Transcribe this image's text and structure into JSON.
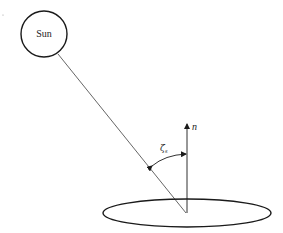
{
  "diagram": {
    "sun_label": "Sun",
    "normal_label": "n",
    "angle_label": "ζ",
    "angle_subscript": "s",
    "colors": {
      "stroke": "#1a1a1a",
      "ray": "#555555",
      "background": "#ffffff"
    }
  }
}
